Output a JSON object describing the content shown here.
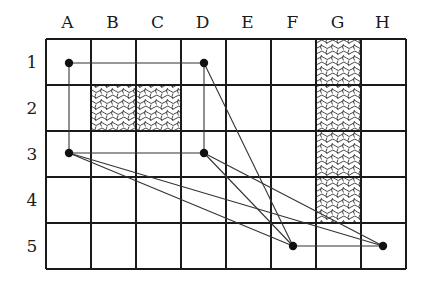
{
  "grid": {
    "columns": [
      "A",
      "B",
      "C",
      "D",
      "E",
      "F",
      "G",
      "H"
    ],
    "rows": [
      "1",
      "2",
      "3",
      "4",
      "5"
    ],
    "origin": [
      46,
      39
    ],
    "cell_width": 45,
    "cell_height": 46,
    "line_color": "#1a1a1a",
    "hatched_cells": [
      "B2",
      "C2",
      "G1",
      "G2",
      "G3",
      "G4"
    ]
  },
  "nodes": [
    {
      "id": "A1",
      "x": 69,
      "y": 63
    },
    {
      "id": "D1",
      "x": 204,
      "y": 63
    },
    {
      "id": "A3",
      "x": 69,
      "y": 153
    },
    {
      "id": "D3",
      "x": 204,
      "y": 153
    },
    {
      "id": "F5",
      "x": 293,
      "y": 246
    },
    {
      "id": "H5",
      "x": 383,
      "y": 246
    }
  ],
  "edges": [
    [
      "A1",
      "D1"
    ],
    [
      "A1",
      "A3"
    ],
    [
      "D1",
      "D3"
    ],
    [
      "D1",
      "F5"
    ],
    [
      "A3",
      "D3"
    ],
    [
      "A3",
      "F5"
    ],
    [
      "A3",
      "H5"
    ],
    [
      "D3",
      "F5"
    ],
    [
      "D3",
      "H5"
    ],
    [
      "F5",
      "H5"
    ]
  ]
}
